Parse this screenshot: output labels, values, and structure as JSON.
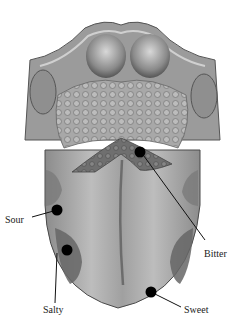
{
  "diagram": {
    "labels": {
      "sour": "Sour",
      "salty": "Salty",
      "bitter": "Bitter",
      "sweet": "Sweet"
    },
    "colors": {
      "background": "#ffffff",
      "tongue_body": "#a9a9a9",
      "tongue_light": "#c4c4c4",
      "papillae": "#9a9a9a",
      "dark_region": "#6e6e6e",
      "outline": "#4a4a4a",
      "dot": "#000000",
      "leader_line": "#111111",
      "text": "#222222"
    }
  }
}
